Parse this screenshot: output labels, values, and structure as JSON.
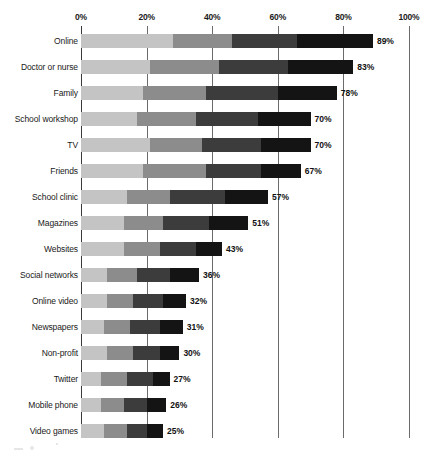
{
  "chart_data": {
    "type": "bar",
    "orientation": "horizontal",
    "stacked": true,
    "title": "",
    "xlabel": "",
    "ylabel": "",
    "xlim": [
      0,
      100
    ],
    "xticks": [
      "0%",
      "20%",
      "40%",
      "60%",
      "80%",
      "100%"
    ],
    "xtick_values": [
      0,
      20,
      40,
      60,
      80,
      100
    ],
    "grid": true,
    "legend": "none",
    "segment_colors": [
      "#c4c4c4",
      "#8c8c8c",
      "#3c3c3c",
      "#141414"
    ],
    "categories": [
      "Online",
      "Doctor or nurse",
      "Family",
      "School workshop",
      "TV",
      "Friends",
      "School clinic",
      "Magazines",
      "Websites",
      "Social networks",
      "Online video",
      "Newspapers",
      "Non-profit",
      "Twitter",
      "Mobile phone",
      "Video games"
    ],
    "values": [
      89,
      83,
      78,
      70,
      70,
      67,
      57,
      51,
      43,
      36,
      32,
      31,
      30,
      27,
      26,
      25
    ],
    "value_labels": [
      "89%",
      "83%",
      "78%",
      "70%",
      "70%",
      "67%",
      "57%",
      "51%",
      "43%",
      "36%",
      "32%",
      "31%",
      "30%",
      "27%",
      "26%",
      "25%"
    ],
    "series": [
      {
        "name": "segment-1",
        "values": [
          28,
          21,
          19,
          17,
          21,
          19,
          14,
          13,
          13,
          8,
          8,
          7,
          8,
          6,
          6,
          7
        ]
      },
      {
        "name": "segment-2",
        "values": [
          18,
          21,
          19,
          18,
          16,
          19,
          13,
          12,
          11,
          9,
          8,
          8,
          8,
          8,
          7,
          7
        ]
      },
      {
        "name": "segment-3",
        "values": [
          20,
          21,
          22,
          19,
          18,
          17,
          17,
          14,
          11,
          10,
          9,
          9,
          8,
          8,
          7,
          6
        ]
      },
      {
        "name": "segment-4",
        "values": [
          23,
          20,
          18,
          16,
          15,
          12,
          13,
          12,
          8,
          9,
          7,
          7,
          6,
          5,
          6,
          5
        ]
      }
    ]
  }
}
